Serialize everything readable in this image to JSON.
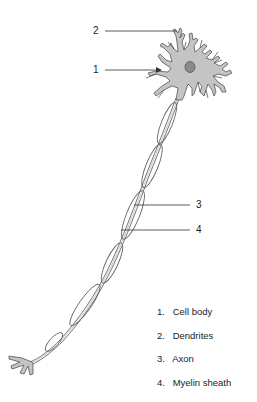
{
  "figure": {
    "colors": {
      "cell_fill": "#c4c4c4",
      "nucleus_fill": "#8a8a8a",
      "outline": "#555555",
      "sheath_stroke": "#666666",
      "leader_line": "#333333"
    }
  },
  "callouts": [
    {
      "number": "1",
      "target": "cell-body"
    },
    {
      "number": "2",
      "target": "dendrites"
    },
    {
      "number": "3",
      "target": "axon"
    },
    {
      "number": "4",
      "target": "myelin-sheath"
    }
  ],
  "legend": [
    {
      "number": "1.",
      "label": "Cell body"
    },
    {
      "number": "2.",
      "label": "Dendrites"
    },
    {
      "number": "3.",
      "label": "Axon"
    },
    {
      "number": "4.",
      "label": "Myelin sheath"
    }
  ]
}
